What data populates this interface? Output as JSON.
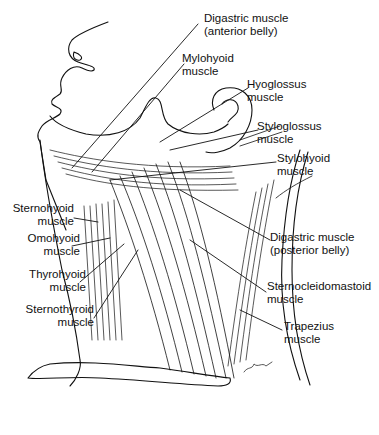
{
  "diagram": {
    "type": "anatomical line illustration",
    "labels": [
      {
        "id": "digastric-anterior",
        "line1": "Digastric muscle",
        "line2": "(anterior belly)"
      },
      {
        "id": "mylohyoid",
        "line1": "Mylohyoid",
        "line2": "muscle"
      },
      {
        "id": "hyoglossus",
        "line1": "Hyoglossus",
        "line2": "muscle"
      },
      {
        "id": "styloglossus",
        "line1": "Styloglossus",
        "line2": "muscle"
      },
      {
        "id": "stylohyoid",
        "line1": "Stylohyoid",
        "line2": "muscle"
      },
      {
        "id": "sternohyoid",
        "line1": "Sternohyoid",
        "line2": "muscle"
      },
      {
        "id": "omohyoid",
        "line1": "Omohyoid",
        "line2": "muscle"
      },
      {
        "id": "thyrohyoid",
        "line1": "Thyrohyoid",
        "line2": "muscle"
      },
      {
        "id": "sternothyroid",
        "line1": "Sternothyroid",
        "line2": "muscle"
      },
      {
        "id": "digastric-posterior",
        "line1": "Digastric muscle",
        "line2": "(posterior belly)"
      },
      {
        "id": "sternocleidomastoid",
        "line1": "Sternocleidomastoid",
        "line2": "muscle"
      },
      {
        "id": "trapezius",
        "line1": "Trapezius",
        "line2": "muscle"
      }
    ],
    "colors": {
      "ink": "#111111",
      "background": "#ffffff"
    }
  }
}
